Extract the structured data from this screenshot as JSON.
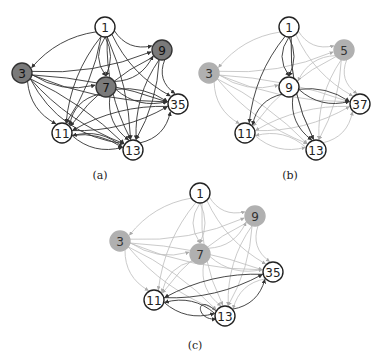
{
  "figure": {
    "panels": [
      {
        "id": "a",
        "caption": "(a)",
        "caption_pos": [
          100,
          179
        ],
        "highlighted_edges": "all",
        "nodes": [
          {
            "label": "1",
            "x": 105,
            "y": 27,
            "fill": "#ffffff",
            "text": "#222222",
            "stroke": "#222222"
          },
          {
            "label": "9",
            "x": 162,
            "y": 50,
            "fill": "#7a7a7a",
            "text": "#111111",
            "stroke": "#333333"
          },
          {
            "label": "3",
            "x": 22,
            "y": 73,
            "fill": "#7a7a7a",
            "text": "#111111",
            "stroke": "#333333"
          },
          {
            "label": "7",
            "x": 106,
            "y": 87,
            "fill": "#7a7a7a",
            "text": "#111111",
            "stroke": "#333333"
          },
          {
            "label": "35",
            "x": 178,
            "y": 104,
            "fill": "#ffffff",
            "text": "#222222",
            "stroke": "#222222"
          },
          {
            "label": "11",
            "x": 62,
            "y": 133,
            "fill": "#ffffff",
            "text": "#222222",
            "stroke": "#222222"
          },
          {
            "label": "13",
            "x": 133,
            "y": 150,
            "fill": "#ffffff",
            "text": "#222222",
            "stroke": "#222222"
          }
        ],
        "dark_edges": [
          [
            0,
            1
          ],
          [
            0,
            2
          ],
          [
            0,
            3
          ],
          [
            0,
            4
          ],
          [
            0,
            5
          ],
          [
            0,
            6
          ],
          [
            0,
            3
          ],
          [
            0,
            5
          ],
          [
            0,
            6
          ],
          [
            2,
            1
          ],
          [
            2,
            3
          ],
          [
            2,
            4
          ],
          [
            2,
            5
          ],
          [
            2,
            6
          ],
          [
            2,
            4
          ],
          [
            2,
            6
          ],
          [
            2,
            6
          ],
          [
            3,
            1
          ],
          [
            3,
            4
          ],
          [
            3,
            5
          ],
          [
            3,
            6
          ],
          [
            3,
            4
          ],
          [
            1,
            4
          ],
          [
            1,
            5
          ],
          [
            1,
            6
          ],
          [
            1,
            6
          ],
          [
            5,
            6
          ],
          [
            5,
            4
          ],
          [
            5,
            6
          ],
          [
            6,
            4
          ],
          [
            4,
            5
          ],
          [
            6,
            5
          ]
        ],
        "light_edges": []
      },
      {
        "id": "b",
        "caption": "(b)",
        "caption_pos": [
          290,
          179
        ],
        "nodes": [
          {
            "label": "1",
            "x": 289,
            "y": 27,
            "fill": "#ffffff",
            "text": "#222222",
            "stroke": "#222222"
          },
          {
            "label": "5",
            "x": 344,
            "y": 50,
            "fill": "#b0b0b0",
            "text": "#333333",
            "stroke": "#b0b0b0"
          },
          {
            "label": "3",
            "x": 209,
            "y": 73,
            "fill": "#b0b0b0",
            "text": "#333333",
            "stroke": "#b0b0b0"
          },
          {
            "label": "9",
            "x": 289,
            "y": 87,
            "fill": "#ffffff",
            "text": "#222222",
            "stroke": "#222222"
          },
          {
            "label": "37",
            "x": 360,
            "y": 104,
            "fill": "#ffffff",
            "text": "#222222",
            "stroke": "#222222"
          },
          {
            "label": "11",
            "x": 245,
            "y": 133,
            "fill": "#ffffff",
            "text": "#222222",
            "stroke": "#222222"
          },
          {
            "label": "13",
            "x": 316,
            "y": 150,
            "fill": "#ffffff",
            "text": "#222222",
            "stroke": "#222222"
          }
        ],
        "dark_edges": [
          [
            0,
            3
          ],
          [
            0,
            3
          ],
          [
            0,
            5
          ],
          [
            0,
            6
          ],
          [
            3,
            4
          ],
          [
            3,
            4
          ],
          [
            3,
            5
          ],
          [
            3,
            6
          ]
        ],
        "light_edges": [
          [
            0,
            1
          ],
          [
            0,
            2
          ],
          [
            0,
            4
          ],
          [
            0,
            6
          ],
          [
            2,
            1
          ],
          [
            2,
            3
          ],
          [
            2,
            4
          ],
          [
            2,
            5
          ],
          [
            2,
            6
          ],
          [
            2,
            4
          ],
          [
            2,
            6
          ],
          [
            1,
            4
          ],
          [
            1,
            5
          ],
          [
            1,
            6
          ],
          [
            1,
            6
          ],
          [
            5,
            6
          ],
          [
            5,
            4
          ],
          [
            6,
            4
          ],
          [
            4,
            5
          ],
          [
            6,
            5
          ],
          [
            1,
            3
          ]
        ]
      },
      {
        "id": "c",
        "caption": "(c)",
        "caption_pos": [
          195,
          349
        ],
        "nodes": [
          {
            "label": "1",
            "x": 200,
            "y": 193,
            "fill": "#ffffff",
            "text": "#222222",
            "stroke": "#222222"
          },
          {
            "label": "9",
            "x": 255,
            "y": 216,
            "fill": "#b0b0b0",
            "text": "#333333",
            "stroke": "#b0b0b0"
          },
          {
            "label": "3",
            "x": 120,
            "y": 241,
            "fill": "#b0b0b0",
            "text": "#333333",
            "stroke": "#b0b0b0"
          },
          {
            "label": "7",
            "x": 200,
            "y": 254,
            "fill": "#b0b0b0",
            "text": "#333333",
            "stroke": "#b0b0b0"
          },
          {
            "label": "35",
            "x": 273,
            "y": 272,
            "fill": "#ffffff",
            "text": "#222222",
            "stroke": "#222222"
          },
          {
            "label": "11",
            "x": 154,
            "y": 300,
            "fill": "#ffffff",
            "text": "#222222",
            "stroke": "#222222"
          },
          {
            "label": "13",
            "x": 225,
            "y": 316,
            "fill": "#ffffff",
            "text": "#222222",
            "stroke": "#222222"
          }
        ],
        "dark_edges": [
          [
            4,
            5
          ],
          [
            5,
            6
          ],
          [
            6,
            4
          ],
          [
            6,
            5
          ],
          [
            5,
            4
          ],
          [
            6,
            6
          ]
        ],
        "light_edges": [
          [
            0,
            1
          ],
          [
            0,
            2
          ],
          [
            0,
            3
          ],
          [
            0,
            4
          ],
          [
            0,
            5
          ],
          [
            0,
            6
          ],
          [
            0,
            3
          ],
          [
            2,
            1
          ],
          [
            2,
            3
          ],
          [
            2,
            4
          ],
          [
            2,
            5
          ],
          [
            2,
            6
          ],
          [
            2,
            4
          ],
          [
            2,
            6
          ],
          [
            3,
            1
          ],
          [
            3,
            4
          ],
          [
            3,
            5
          ],
          [
            3,
            6
          ],
          [
            1,
            4
          ],
          [
            1,
            5
          ],
          [
            1,
            6
          ],
          [
            1,
            6
          ],
          [
            4,
            6
          ]
        ]
      }
    ],
    "colors": {
      "dark_edge": "#333333",
      "light_edge": "#bdbdbd",
      "node_radius": 10
    }
  }
}
